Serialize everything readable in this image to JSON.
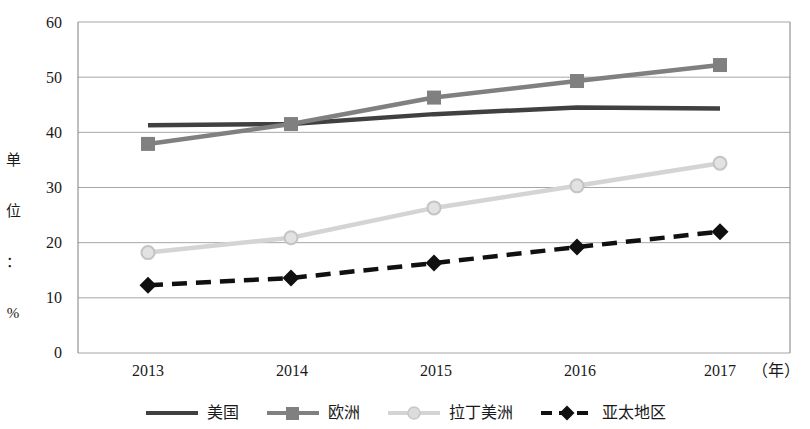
{
  "chart_data": {
    "type": "line",
    "title": "",
    "subtitle": "",
    "xlabel": "年",
    "ylabel": "单位：%",
    "x": [
      "2013",
      "2014",
      "2015",
      "2016",
      "2017"
    ],
    "categories": [
      "2013",
      "2014",
      "2015",
      "2016",
      "2017"
    ],
    "xlim": [
      2013,
      2017
    ],
    "ylim": [
      0,
      60
    ],
    "yticks": [
      "0",
      "10",
      "20",
      "30",
      "40",
      "50",
      "60"
    ],
    "ytick_values": [
      0,
      10,
      20,
      30,
      40,
      50,
      60
    ],
    "grid": "horizontal",
    "legend_position": "bottom",
    "series": [
      {
        "name": "美国",
        "values": [
          41.3,
          41.5,
          43.3,
          44.5,
          44.3
        ],
        "color": "#404040",
        "marker": "none",
        "dash": "solid"
      },
      {
        "name": "欧洲",
        "values": [
          37.9,
          41.5,
          46.3,
          49.3,
          52.2
        ],
        "color": "#808080",
        "marker": "square",
        "dash": "solid"
      },
      {
        "name": "拉丁美洲",
        "values": [
          18.2,
          20.9,
          26.3,
          30.3,
          34.4
        ],
        "color": "#d4d4d4",
        "marker": "circle",
        "dash": "solid"
      },
      {
        "name": "亚太地区",
        "values": [
          12.3,
          13.6,
          16.3,
          19.2,
          22.0
        ],
        "color": "#101010",
        "marker": "diamond",
        "dash": "dashed"
      }
    ]
  },
  "axes": {
    "y_title_chars": [
      "单",
      "位",
      "：",
      "%"
    ],
    "x_unit_label": "（年）"
  },
  "legend": {
    "items": [
      {
        "label": "美国"
      },
      {
        "label": "欧洲"
      },
      {
        "label": "拉丁美洲"
      },
      {
        "label": "亚太地区"
      }
    ]
  },
  "colors": {
    "gridline": "#a6a6a6",
    "frame": "#7f7f7f",
    "text": "#1a1a1a",
    "background": "#ffffff"
  }
}
